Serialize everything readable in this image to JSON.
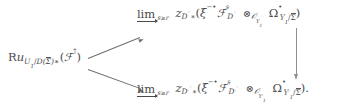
{
  "figure": {
    "kind": "commutative-diagram",
    "background_color": "#ffffff",
    "ink_color": "#4a4a4a",
    "arrow_color": "#6e6e6e"
  },
  "source": {
    "label": "Ru_{U_1/D(\\overline{\\Sigma})*}(\\mathcal{F}^{\\dagger})",
    "operator": "Ru",
    "subscript_main": "U",
    "subscript_index": "1",
    "subscript_slash": "/",
    "subscript_D": "D",
    "subscript_paren_open": "(",
    "subscript_sigma": "Σ",
    "subscript_paren_close": ")",
    "subscript_star": "∗",
    "arg_open": "(",
    "arg_script": "F",
    "arg_dagger": "†",
    "arg_close": ")"
  },
  "top_target": {
    "colimit_word": "lim",
    "colimit_index": "s ≥ r",
    "colimit_index_var": "s",
    "colimit_rel": "≥",
    "colimit_bound": "r",
    "map": "z",
    "map_sub": "D°",
    "map_star": "∗",
    "paren_open": "(",
    "xi": "ξ",
    "xi_sup_minus": "−",
    "xi_sup_bullet": "•",
    "sheaf": "F",
    "sheaf_sup": "s",
    "sheaf_sub": "D°",
    "tensor": "⊗",
    "tensor_sub_O": "O",
    "tensor_sub_Y": "Y",
    "tensor_sub_index": "1",
    "omega": "Ω",
    "omega_sup": "•",
    "omega_sub_Y": "Y",
    "omega_sub_index": "1",
    "omega_sub_slash": "/",
    "omega_sub_sigma": "Σ",
    "paren_close": ")",
    "trailing": ""
  },
  "bottom_target": {
    "colimit_word": "lim",
    "colimit_index": "s ≥ r",
    "colimit_index_var": "s",
    "colimit_rel": "≥",
    "colimit_bound": "r",
    "map": "z",
    "map_sub": "D′°",
    "map_star": "∗",
    "paren_open": "(",
    "xi": "ξ",
    "xi_sup_minus": "−",
    "xi_sup_bullet": "•",
    "sheaf": "F",
    "sheaf_sup": "s",
    "sheaf_sub": "D′°",
    "tensor": "⊗",
    "tensor_sub_O": "O",
    "tensor_sub_Y": "Y",
    "tensor_sub_prime": "′",
    "tensor_sub_index": "1",
    "omega": "Ω",
    "omega_sup": "•",
    "omega_sub_Y": "Y",
    "omega_sub_prime": "′",
    "omega_sub_index": "1",
    "omega_sub_slash": "/",
    "omega_sub_sigma": "Σ",
    "paren_close": ")",
    "trailing": "."
  },
  "arrows": {
    "upper": {
      "name": "arrow-to-top-colimit",
      "direction": "up-right",
      "style": "solid"
    },
    "lower": {
      "name": "arrow-to-bottom-colimit",
      "direction": "down-right",
      "style": "solid"
    },
    "vertical": {
      "name": "arrow-top-to-bottom",
      "direction": "down",
      "style": "solid"
    }
  }
}
